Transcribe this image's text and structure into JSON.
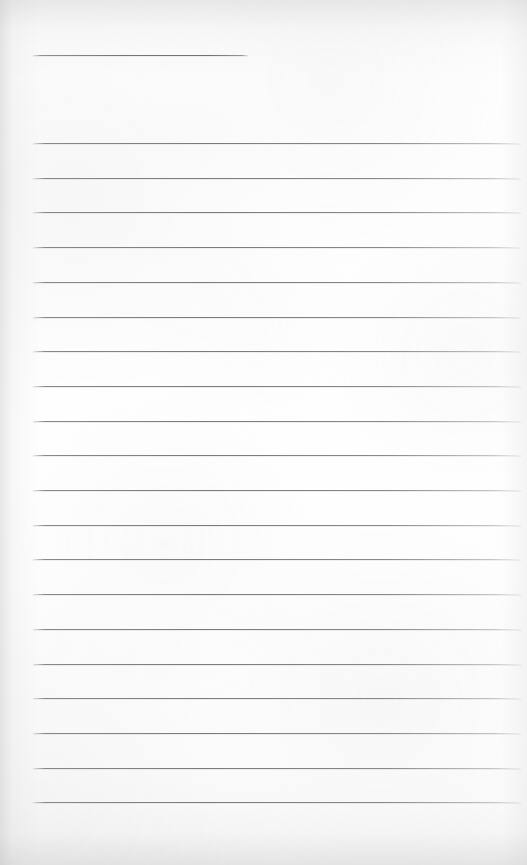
{
  "document": {
    "type": "scanned-ruled-page",
    "title": "",
    "visible_text": "",
    "page_width": 527,
    "page_height": 865,
    "paper_color": "#fcfcfc",
    "rule_color": "#767679",
    "description_note": ""
  },
  "header_rule": {
    "name": "header-rule",
    "x": 33,
    "y": 55,
    "width": 215,
    "thickness": 1
  },
  "rules": {
    "name": "ruled-lines",
    "count": 20,
    "left_x": 33,
    "right_x": 521,
    "first_y": 143,
    "spacing": 34.7,
    "thickness": 1,
    "y_positions": [
      143,
      177.7,
      212.4,
      247.1,
      281.8,
      316.5,
      351.2,
      385.9,
      420.6,
      455.3,
      490,
      524.7,
      559.4,
      594.1,
      628.8,
      663.5,
      698.2,
      732.9,
      767.6,
      802.3
    ]
  }
}
